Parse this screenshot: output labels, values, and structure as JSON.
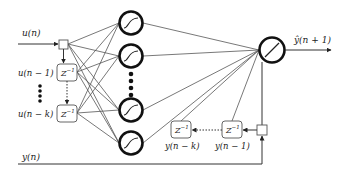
{
  "diagram": {
    "type": "neural-network-narx",
    "inputs": {
      "input_label": "u(n)",
      "delayed_labels": [
        "u(n − 1)",
        "u(n − k)"
      ],
      "delay_block_label": "Z",
      "delay_block_exponent": "−1"
    },
    "hidden_layer": {
      "neuron_count_shown": 4,
      "activation": "sigmoid",
      "ellipsis": "⋮"
    },
    "output_layer": {
      "activation": "linear",
      "output_label": "ŷ(n + 1)"
    },
    "feedback": {
      "target_label": "y(n)",
      "delayed_labels": [
        "y(n − k)",
        "y(n − 1)"
      ],
      "delay_block_label": "Z",
      "delay_block_exponent": "−1"
    },
    "colors": {
      "background": "#ffffff",
      "stroke": "#111111",
      "edge": "#555555"
    }
  }
}
